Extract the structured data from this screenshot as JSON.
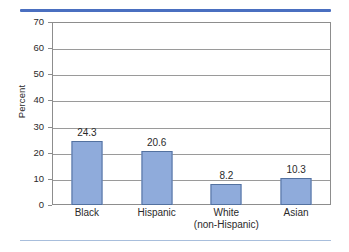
{
  "figure": {
    "top_rule_color": "#4a6fc0",
    "bottom_rule_color": "#a8bedc",
    "bar_fill_color": "#8fabdb",
    "bar_border_color": "#53719f"
  },
  "chart_data": {
    "type": "bar",
    "title": "",
    "xlabel": "",
    "ylabel": "Percent",
    "categories": [
      "Black",
      "Hispanic",
      "White",
      "Asian"
    ],
    "category_sublabels": [
      "",
      "",
      "(non-Hispanic)",
      ""
    ],
    "values": [
      24.3,
      20.6,
      8.2,
      10.3
    ],
    "value_labels": [
      "24.3",
      "20.6",
      "8.2",
      "10.3"
    ],
    "ylim": [
      0,
      70
    ],
    "yticks": [
      0,
      10,
      20,
      30,
      40,
      50,
      60,
      70
    ],
    "ytick_labels": [
      "0",
      "10",
      "20",
      "30",
      "40",
      "50",
      "60",
      "70"
    ],
    "grid": true,
    "legend": false
  }
}
